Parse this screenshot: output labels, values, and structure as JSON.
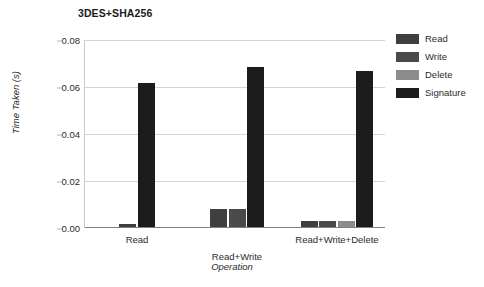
{
  "chart_data": {
    "type": "bar",
    "title": "3DES+SHA256",
    "xlabel": "Operation",
    "ylabel": "Time Taken (s)",
    "categories": [
      "Read",
      "Read+Write",
      "Read+Write+Delete"
    ],
    "ylim": [
      0,
      0.08
    ],
    "ytick_labels": [
      "0.00",
      "0.02",
      "0.04",
      "0.06",
      "0.08"
    ],
    "ytick_values": [
      0,
      0.02,
      0.04,
      0.06,
      0.08
    ],
    "grid": "horizontal",
    "legend_position": "right",
    "series": [
      {
        "name": "Read",
        "color": "#3f3f3f",
        "values": [
          0.0018,
          0.008,
          0.003
        ]
      },
      {
        "name": "Write",
        "color": "#4a4a4a",
        "values": [
          null,
          0.008,
          0.003
        ]
      },
      {
        "name": "Delete",
        "color": "#8c8c8c",
        "values": [
          null,
          null,
          0.003
        ]
      },
      {
        "name": "Signature",
        "color": "#1c1c1c",
        "values": [
          0.0615,
          0.0685,
          0.0668
        ]
      }
    ]
  },
  "legend": {
    "items": [
      {
        "label": "Read",
        "color": "#3f3f3f"
      },
      {
        "label": "Write",
        "color": "#4a4a4a"
      },
      {
        "label": "Delete",
        "color": "#8c8c8c"
      },
      {
        "label": "Signature",
        "color": "#1c1c1c"
      }
    ]
  }
}
